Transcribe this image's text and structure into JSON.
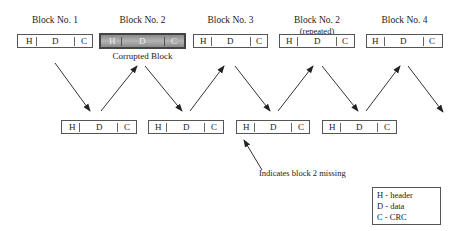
{
  "top_row": [
    {
      "label": "Block No. 1",
      "sublabel": "",
      "corrupted": false,
      "fields": [
        "H",
        "D",
        "C"
      ]
    },
    {
      "label": "Block No. 2",
      "sublabel": "",
      "corrupted": true,
      "fields": [
        "H",
        "D",
        "C"
      ]
    },
    {
      "label": "Block No. 3",
      "sublabel": "",
      "corrupted": false,
      "fields": [
        "H",
        "D",
        "C"
      ]
    },
    {
      "label": "Block No. 2",
      "sublabel": "(repeated)",
      "corrupted": false,
      "fields": [
        "H",
        "D",
        "C"
      ]
    },
    {
      "label": "Block No. 4",
      "sublabel": "",
      "corrupted": false,
      "fields": [
        "H",
        "D",
        "C"
      ]
    }
  ],
  "corrupted_caption": "Corrupted Block",
  "bottom_row": [
    {
      "fields": [
        "H",
        "D",
        "C"
      ]
    },
    {
      "fields": [
        "H",
        "D",
        "C"
      ]
    },
    {
      "fields": [
        "H",
        "D",
        "C"
      ]
    },
    {
      "fields": [
        "H",
        "D",
        "C"
      ]
    }
  ],
  "annotation": "Indicates block 2 missing",
  "legend": {
    "items": [
      "H - header",
      "D - data",
      "C - CRC"
    ]
  }
}
